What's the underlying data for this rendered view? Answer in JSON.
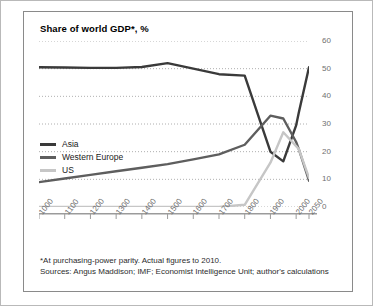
{
  "chart_data": {
    "type": "line",
    "title": "Share of world GDP*, %",
    "xlabel": "",
    "ylabel": "",
    "xlim": [
      1000,
      2050
    ],
    "ylim": [
      0,
      60
    ],
    "grid": true,
    "grid_axis": "y",
    "legend_position": "inside-left",
    "y_ticks": [
      0,
      10,
      20,
      30,
      40,
      50,
      60
    ],
    "y_tick_labels": [
      "0",
      "10",
      "20",
      "30",
      "40",
      "50",
      "60"
    ],
    "x_ticks": [
      1000,
      1100,
      1200,
      1300,
      1400,
      1500,
      1600,
      1700,
      1800,
      1900,
      2000,
      2050
    ],
    "x_tick_labels": [
      "1000",
      "1100",
      "1200",
      "1300",
      "1400",
      "1500",
      "1600",
      "1700",
      "1800",
      "1900",
      "2000",
      "2050"
    ],
    "x": [
      1000,
      1100,
      1200,
      1300,
      1400,
      1500,
      1600,
      1700,
      1800,
      1900,
      1950,
      2000,
      2010,
      2050
    ],
    "series": [
      {
        "name": "Asia",
        "color": "#3a3a3a",
        "values": [
          50.5,
          50.4,
          50.3,
          50.3,
          50.6,
          52.0,
          50.0,
          48.0,
          47.5,
          20.0,
          16.5,
          29.5,
          34.0,
          50.5
        ]
      },
      {
        "name": "Western Europe",
        "color": "#5e5e5e",
        "values": [
          9.0,
          10.3,
          11.6,
          12.9,
          14.2,
          15.5,
          17.2,
          19.0,
          22.5,
          33.0,
          32.0,
          23.5,
          21.0,
          9.5
        ]
      },
      {
        "name": "US",
        "color": "#c6c6c6",
        "values": [
          0.0,
          0.0,
          0.0,
          0.0,
          0.0,
          0.0,
          0.0,
          0.0,
          0.8,
          16.0,
          27.0,
          22.0,
          21.0,
          10.5
        ]
      }
    ],
    "annotations": []
  },
  "legend": {
    "items": [
      {
        "label": "Asia",
        "color": "#3a3a3a"
      },
      {
        "label": "Western Europe",
        "color": "#5e5e5e"
      },
      {
        "label": "US",
        "color": "#c6c6c6"
      }
    ]
  },
  "footnotes": {
    "line1": "*At purchasing-power parity. Actual figures to 2010.",
    "line2": "Sources: Angus Maddison; IMF; Economist Intelligence Unit; author's calculations"
  },
  "colors": {
    "panel_border": "#8a8a8a",
    "outer_border": "#b9b9b9",
    "grid": "#9b9b9b",
    "axis": "#9b9b9b",
    "tick_text": "#6f6f6f",
    "title_text": "#000000",
    "footnote_text": "#2c2c2c"
  }
}
